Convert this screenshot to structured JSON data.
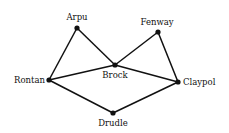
{
  "diagram": {
    "type": "graph",
    "colors": {
      "edge": "#111111",
      "node": "#111111",
      "background": "#ffffff"
    },
    "nodes": [
      {
        "id": "arpu",
        "label": "Arpu",
        "x": 77,
        "y": 28,
        "lx": 77,
        "ly": 20,
        "anchor": "middle"
      },
      {
        "id": "fenway",
        "label": "Fenway",
        "x": 158,
        "y": 32,
        "lx": 157,
        "ly": 25,
        "anchor": "middle"
      },
      {
        "id": "brock",
        "label": "Brock",
        "x": 115,
        "y": 65,
        "lx": 115,
        "ly": 78,
        "anchor": "middle"
      },
      {
        "id": "rontan",
        "label": "Rontan",
        "x": 49,
        "y": 80,
        "lx": 45,
        "ly": 83,
        "anchor": "end"
      },
      {
        "id": "claypol",
        "label": "Claypol",
        "x": 178,
        "y": 82,
        "lx": 183,
        "ly": 85,
        "anchor": "start"
      },
      {
        "id": "drudle",
        "label": "Drudle",
        "x": 113,
        "y": 113,
        "lx": 113,
        "ly": 126,
        "anchor": "middle"
      }
    ],
    "edges": [
      {
        "from": "arpu",
        "to": "rontan"
      },
      {
        "from": "arpu",
        "to": "brock"
      },
      {
        "from": "rontan",
        "to": "brock"
      },
      {
        "from": "brock",
        "to": "fenway"
      },
      {
        "from": "brock",
        "to": "claypol"
      },
      {
        "from": "fenway",
        "to": "claypol"
      },
      {
        "from": "rontan",
        "to": "drudle"
      },
      {
        "from": "drudle",
        "to": "claypol"
      }
    ]
  }
}
